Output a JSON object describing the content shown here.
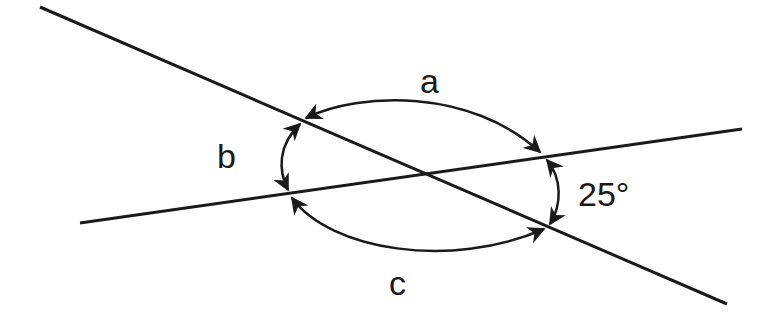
{
  "diagram": {
    "labels": {
      "a": "a",
      "b": "b",
      "c": "c",
      "given_angle": "25°"
    },
    "stroke_color": "#1a1a1a",
    "background": "#ffffff"
  }
}
